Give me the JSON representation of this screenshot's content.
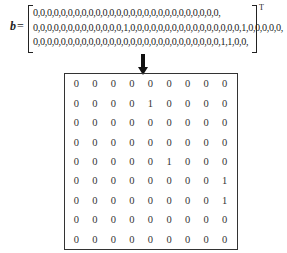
{
  "equation": {
    "symbol": "b",
    "equals": "=",
    "transpose": "T",
    "rows": [
      "0,0,0,0,0,0,0,0,0,0,0,0,0,0,0,0,0,0,0,0,0,0,0,0,0,0,0,",
      "0,0,0,0,0,0,0,0,0,0,0,0,0,1,0,0,0,0,0,0,0,0,0,0,0,0,0,0,0,0,1,0,0,0,0,0,",
      "0,0,0,0,0,0,0,0,0,0,0,0,0,0,0,0,0,0,0,0,0,0,0,0,0,0,0,1,1,0,0,"
    ]
  },
  "arrow": {
    "direction": "down"
  },
  "grid": {
    "rows": 9,
    "cols": 9,
    "cells": [
      [
        "0",
        "0",
        "0",
        "0",
        "0",
        "0",
        "0",
        "0",
        "0"
      ],
      [
        "0",
        "0",
        "0",
        "0",
        "1",
        "0",
        "0",
        "0",
        "0"
      ],
      [
        "0",
        "0",
        "0",
        "0",
        "0",
        "0",
        "0",
        "0",
        "0"
      ],
      [
        "0",
        "0",
        "0",
        "0",
        "0",
        "0",
        "0",
        "0",
        "0"
      ],
      [
        "0",
        "0",
        "0",
        "0",
        "0",
        "1",
        "0",
        "0",
        "0"
      ],
      [
        "0",
        "0",
        "0",
        "0",
        "0",
        "0",
        "0",
        "0",
        "1"
      ],
      [
        "0",
        "0",
        "0",
        "0",
        "0",
        "0",
        "0",
        "0",
        "1"
      ],
      [
        "0",
        "0",
        "0",
        "0",
        "0",
        "0",
        "0",
        "0",
        "0"
      ],
      [
        "0",
        "0",
        "0",
        "0",
        "0",
        "0",
        "0",
        "0",
        "0"
      ]
    ]
  }
}
